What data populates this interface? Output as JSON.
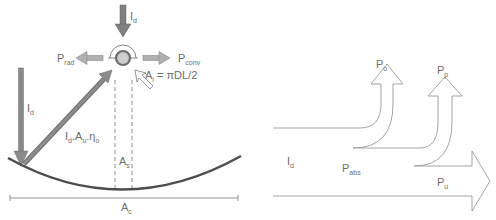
{
  "left_panel": {
    "title": "Parabolic trough collector energy balance",
    "labels": {
      "top_irradiance": {
        "main": "I",
        "sub": "d"
      },
      "radiation_loss": {
        "main": "P",
        "sub": "rad"
      },
      "convection_loss": {
        "main": "P",
        "sub": "conv"
      },
      "receiver_area": {
        "main": "A",
        "sub": "i",
        "rest": " = πDL/2"
      },
      "direct_irradiance": {
        "main": "I",
        "sub": "d"
      },
      "reflected_beam": {
        "p1": "I",
        "s1": "d",
        "p2": ".A",
        "s2": "u",
        "p3": ".η",
        "s3": "o"
      },
      "shadow_area": {
        "main": "A",
        "sub": "s"
      },
      "collector_area": {
        "main": "A",
        "sub": "c"
      }
    }
  },
  "right_panel": {
    "title": "Energy flow diagram",
    "labels": {
      "input": {
        "main": "I",
        "sub": "d"
      },
      "absorbed": {
        "main": "P",
        "sub": "abs"
      },
      "useful": {
        "main": "P",
        "sub": "u"
      },
      "optical_loss": {
        "main": "P",
        "sub": "o"
      },
      "thermal_loss": {
        "main": "P",
        "sub": "p"
      }
    }
  },
  "colors": {
    "arrow_fill": "#8c8c8c",
    "arrow_dark": "#6f6f6f",
    "curve": "#4d4d4d",
    "outline": "#9a9a9a",
    "text": "#6d6d6d",
    "receiver_ring": "#7a7a7a",
    "receiver_core": "#c8c8c8"
  }
}
